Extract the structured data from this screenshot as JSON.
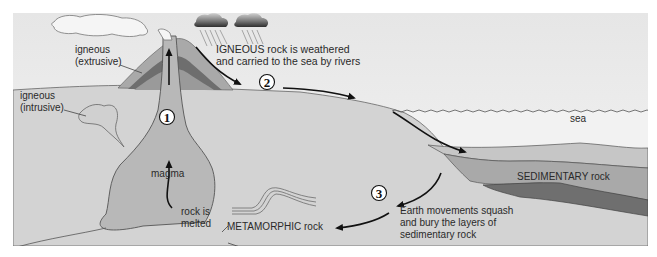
{
  "diagram": {
    "colors": {
      "background": "#ffffff",
      "sky": "#ececec",
      "land": "#d3d3d3",
      "magma": "#b5b5b5",
      "volcano_outer": "#a9a9a9",
      "volcano_inner": "#6e6e6e",
      "sediment_light": "#c4c4c4",
      "sediment_mid": "#a8a8a8",
      "sediment_dark": "#707070",
      "arrow": "#111111",
      "text": "#2a2a2a"
    },
    "labels": {
      "igneous_extrusive_line1": "igneous",
      "igneous_extrusive_line2": "(extrusive)",
      "igneous_intrusive_line1": "igneous",
      "igneous_intrusive_line2": "(intrusive)",
      "weathered_line1": "IGNEOUS rock is weathered",
      "weathered_line2": "and carried to the sea by rivers",
      "sea": "sea",
      "sedimentary": "SEDIMENTARY rock",
      "magma": "magma",
      "rock_melted_line1": "rock is",
      "rock_melted_line2": "melted",
      "metamorphic": "METAMORPHIC rock",
      "earth_movements_line1": "Earth movements squash",
      "earth_movements_line2": "and bury the layers of",
      "earth_movements_line3": "sedimentary rock"
    },
    "steps": [
      {
        "number": "1"
      },
      {
        "number": "2"
      },
      {
        "number": "3"
      }
    ],
    "icons": [
      "volcano-icon",
      "smoke-cloud-icon",
      "rain-cloud-icon",
      "rain-cloud-icon",
      "folded-strata-icon"
    ]
  }
}
